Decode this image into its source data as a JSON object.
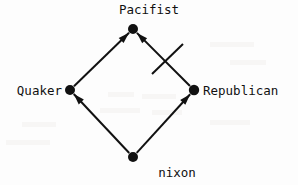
{
  "figure": {
    "type": "inheritance-network-diagram",
    "name": "Nixon Diamond",
    "background_color": "#fdfdfd",
    "ink_color": "#111111"
  },
  "nodes": [
    {
      "id": "pacifist",
      "label": "Pacifist",
      "x": 133,
      "y": 29,
      "radius": 5.0,
      "label_position": "above"
    },
    {
      "id": "quaker",
      "label": "Quaker",
      "x": 70,
      "y": 90,
      "radius": 5.0,
      "label_position": "left"
    },
    {
      "id": "republican",
      "label": "Republican",
      "x": 194,
      "y": 90,
      "radius": 5.2,
      "label_position": "right"
    },
    {
      "id": "nixon",
      "label": "nixon",
      "x": 133,
      "y": 157,
      "radius": 5.0,
      "label_position": "below"
    }
  ],
  "edges": [
    {
      "id": "nixon-to-quaker",
      "from": "nixon",
      "to": "quaker",
      "arrow": true,
      "strike": false
    },
    {
      "id": "nixon-to-republican",
      "from": "nixon",
      "to": "republican",
      "arrow": true,
      "strike": false
    },
    {
      "id": "quaker-to-pacifist",
      "from": "quaker",
      "to": "pacifist",
      "arrow": true,
      "strike": false
    },
    {
      "id": "republican-to-pacifist",
      "from": "republican",
      "to": "pacifist",
      "arrow": true,
      "strike": true
    }
  ],
  "strike_mark": {
    "id": "negation-slash",
    "x1": 152,
    "y1": 74,
    "x2": 183,
    "y2": 44,
    "meaning": "blocked-or-defeated-inference"
  },
  "style": {
    "line_width": 2.0,
    "arrow_length": 11,
    "arrow_width": 7
  }
}
